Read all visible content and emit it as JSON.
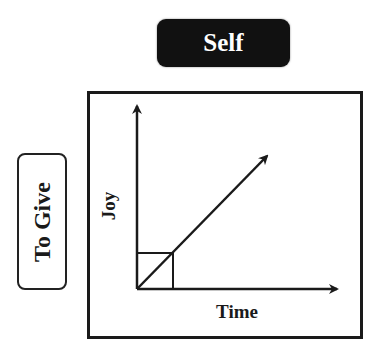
{
  "header": {
    "badge_label": "Self"
  },
  "side": {
    "label": "To Give"
  },
  "graph": {
    "x_axis_label": "Time",
    "y_axis_label": "Joy",
    "line_relationship": "linear increasing from origin",
    "marker": "square under line at start"
  },
  "colors": {
    "badge_background": "#111111",
    "badge_text": "#ffffff",
    "ink": "#1a1a1a",
    "background": "#ffffff"
  }
}
